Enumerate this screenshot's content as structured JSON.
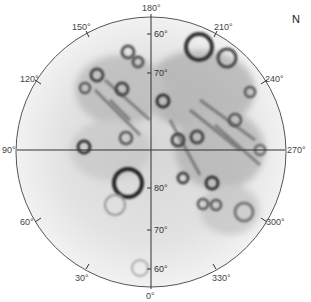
{
  "map": {
    "type": "polar-stereographic",
    "hemisphere_label": "N",
    "center": {
      "x": 151,
      "y": 152
    },
    "radius": 135,
    "longitude_labels": [
      {
        "text": "180°",
        "x": 142,
        "y": 4
      },
      {
        "text": "150°",
        "x": 72,
        "y": 23
      },
      {
        "text": "210°",
        "x": 214,
        "y": 23
      },
      {
        "text": "120°",
        "x": 20,
        "y": 75
      },
      {
        "text": "240°",
        "x": 265,
        "y": 75
      },
      {
        "text": "90°",
        "x": 2,
        "y": 146
      },
      {
        "text": "270°",
        "x": 287,
        "y": 146
      },
      {
        "text": "60°",
        "x": 20,
        "y": 218
      },
      {
        "text": "300°",
        "x": 266,
        "y": 218
      },
      {
        "text": "30°",
        "x": 75,
        "y": 274
      },
      {
        "text": "330°",
        "x": 212,
        "y": 274
      },
      {
        "text": "0°",
        "x": 146,
        "y": 292
      }
    ],
    "latitude_labels": [
      {
        "text": "60°",
        "x": 154,
        "y": 30
      },
      {
        "text": "70°",
        "x": 154,
        "y": 69
      },
      {
        "text": "80°",
        "x": 154,
        "y": 184
      },
      {
        "text": "70°",
        "x": 154,
        "y": 226
      },
      {
        "text": "60°",
        "x": 154,
        "y": 265
      }
    ],
    "colors": {
      "outline": "#555555",
      "surface_light": "#f4f4f4",
      "surface_mid": "#c8c8c8",
      "surface_dark": "#3a3a3a"
    }
  }
}
